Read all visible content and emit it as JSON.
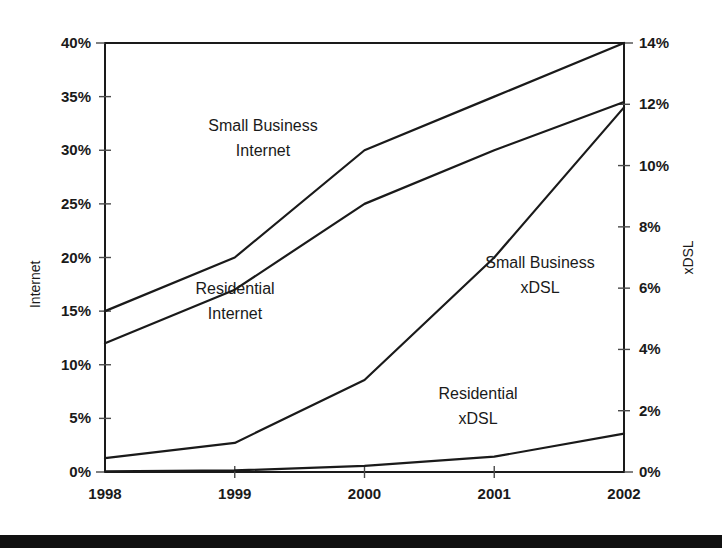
{
  "chart_data": {
    "type": "line",
    "title": "",
    "xlabel": "",
    "ylabel": "Internet",
    "y2label": "xDSL",
    "grid": false,
    "legend_position": "inline-annotations",
    "x": [
      "1998",
      "1999",
      "2000",
      "2001",
      "2002"
    ],
    "ylim": [
      0,
      40
    ],
    "y2lim": [
      0,
      14
    ],
    "yticks": [
      "0%",
      "5%",
      "10%",
      "15%",
      "20%",
      "25%",
      "30%",
      "35%",
      "40%"
    ],
    "ytick_values": [
      0,
      5,
      10,
      15,
      20,
      25,
      30,
      35,
      40
    ],
    "y2ticks": [
      "0%",
      "2%",
      "4%",
      "6%",
      "8%",
      "10%",
      "12%",
      "14%"
    ],
    "y2tick_values": [
      0,
      2,
      4,
      6,
      8,
      10,
      12,
      14
    ],
    "series": [
      {
        "name": "Small Business Internet",
        "axis": "left",
        "unit": "%",
        "values": [
          15.0,
          20.0,
          30.0,
          35.0,
          40.0
        ]
      },
      {
        "name": "Residential Internet",
        "axis": "left",
        "unit": "%",
        "values": [
          12.0,
          17.0,
          25.0,
          30.0,
          34.5
        ]
      },
      {
        "name": "Small Business xDSL",
        "axis": "right",
        "unit": "%",
        "values": [
          0.45,
          0.95,
          3.0,
          7.0,
          11.9
        ]
      },
      {
        "name": "Residential xDSL",
        "axis": "right",
        "unit": "%",
        "values": [
          0.02,
          0.05,
          0.2,
          0.5,
          1.25
        ]
      }
    ],
    "annotations": [
      {
        "text_line1": "Small Business",
        "text_line2": "Internet",
        "x": 263,
        "y": 131
      },
      {
        "text_line1": "Residential",
        "text_line2": "Internet",
        "x": 235,
        "y": 294
      },
      {
        "text_line1": "Small Business",
        "text_line2": "xDSL",
        "x": 540,
        "y": 268
      },
      {
        "text_line1": "Residential",
        "text_line2": "xDSL",
        "x": 478,
        "y": 399
      }
    ]
  },
  "axes": {
    "left_title": "Internet",
    "right_title": "xDSL"
  }
}
